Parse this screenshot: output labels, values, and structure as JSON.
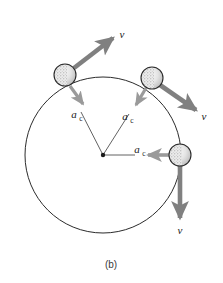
{
  "figure": {
    "caption": "(b)",
    "background_color": "#ffffff",
    "orbit": {
      "center_x": 103,
      "center_y": 155,
      "radius": 78,
      "stroke_color": "#2b2b2b",
      "stroke_width": 1
    },
    "colors": {
      "velocity_arrow": "#808080",
      "acceleration_arrow": "#9a9a9a",
      "leader_line": "#3a3a3a",
      "ball_outline": "#2b2b2b",
      "ball_fill": "#e8e8e8",
      "ball_stipple": "#9b9b9b",
      "label_text": "#1a1a1a"
    },
    "labels": {
      "velocity_symbol": "v",
      "acceleration_symbol": "a",
      "acceleration_subscript": "c"
    },
    "balls": [
      {
        "id": "ball-upper-left",
        "cx": 65,
        "cy": 75,
        "r": 11,
        "velocity": {
          "label": "v",
          "from_x": 74,
          "from_y": 68,
          "to_x": 113,
          "to_y": 38,
          "label_x": 122,
          "label_y": 38,
          "direction": "up-right"
        },
        "acceleration": {
          "label": "a",
          "subscript": "c",
          "from_x": 70,
          "from_y": 86,
          "to_x": 83,
          "to_y": 104,
          "label_x": 74,
          "label_y": 118,
          "subscript_x": 82,
          "subscript_y": 121,
          "direction": "down-right-toward-center"
        },
        "leader": {
          "x1": 103,
          "y1": 155,
          "x2": 81,
          "y2": 112
        }
      },
      {
        "id": "ball-upper-right",
        "cx": 152,
        "cy": 78,
        "r": 11,
        "velocity": {
          "label": "v",
          "from_x": 160,
          "from_y": 85,
          "to_x": 196,
          "to_y": 110,
          "label_x": 204,
          "label_y": 120,
          "direction": "down-right"
        },
        "acceleration": {
          "label": "a",
          "subscript": "c",
          "from_x": 146,
          "from_y": 88,
          "to_x": 136,
          "to_y": 105,
          "label_x": 125,
          "label_y": 120,
          "subscript_x": 133,
          "subscript_y": 123,
          "direction": "down-left-toward-center"
        },
        "leader": {
          "x1": 103,
          "y1": 155,
          "x2": 129,
          "y2": 114
        }
      },
      {
        "id": "ball-right",
        "cx": 180,
        "cy": 155,
        "r": 11,
        "velocity": {
          "label": "v",
          "from_x": 180,
          "from_y": 166,
          "to_x": 180,
          "to_y": 218,
          "label_x": 180,
          "label_y": 234,
          "direction": "down"
        },
        "acceleration": {
          "label": "a",
          "subscript": "c",
          "from_x": 169,
          "from_y": 155,
          "to_x": 148,
          "to_y": 155,
          "label_x": 137,
          "label_y": 152,
          "subscript_x": 145,
          "subscript_y": 155,
          "direction": "left-toward-center"
        },
        "leader": {
          "x1": 103,
          "y1": 155,
          "x2": 135,
          "y2": 155
        }
      }
    ],
    "center_marker": {
      "cx": 103,
      "cy": 155,
      "r": 2.2
    }
  }
}
